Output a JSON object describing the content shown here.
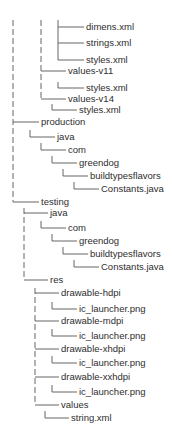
{
  "tree": {
    "rows": [
      {
        "label": "dimens.xml",
        "x": 85,
        "y": 27,
        "conn": [
          58,
          84
        ],
        "branch_x": 58
      },
      {
        "label": "strings.xml",
        "x": 85,
        "y": 43,
        "conn": [
          58,
          84
        ],
        "branch_x": 58
      },
      {
        "label": "styles.xml",
        "x": 85,
        "y": 60,
        "conn": [
          58,
          84
        ],
        "branch_x": 58
      },
      {
        "label": "values-v11",
        "x": 67,
        "y": 71,
        "conn": [
          41,
          66
        ],
        "branch_x": 41
      },
      {
        "label": "styles.xml",
        "x": 85,
        "y": 88,
        "conn": [
          58,
          84
        ],
        "branch_x": 58
      },
      {
        "label": "values-v14",
        "x": 67,
        "y": 99,
        "conn": [
          41,
          66
        ],
        "branch_x": 41
      },
      {
        "label": "styles.xml",
        "x": 78,
        "y": 110,
        "conn": [
          52,
          77
        ],
        "branch_x": 52
      },
      {
        "label": "production",
        "x": 40,
        "y": 122,
        "conn": [
          13,
          39
        ],
        "branch_x": 13
      },
      {
        "label": "java",
        "x": 56,
        "y": 137,
        "conn": [
          30,
          55
        ],
        "branch_x": 30
      },
      {
        "label": "com",
        "x": 67,
        "y": 150,
        "conn": [
          41,
          66
        ],
        "branch_x": 41
      },
      {
        "label": "greendog",
        "x": 78,
        "y": 163,
        "conn": [
          52,
          77
        ],
        "branch_x": 52
      },
      {
        "label": "buildtypesflavors",
        "x": 89,
        "y": 176,
        "conn": [
          63,
          88
        ],
        "branch_x": 63
      },
      {
        "label": "Constants.java",
        "x": 100,
        "y": 189,
        "conn": [
          74,
          99
        ],
        "branch_x": 74
      },
      {
        "label": "testing",
        "x": 40,
        "y": 202,
        "conn": [
          13,
          39
        ],
        "branch_x": 13
      },
      {
        "label": "java",
        "x": 49,
        "y": 213,
        "conn": [
          24,
          48
        ],
        "branch_x": 24
      },
      {
        "label": "com",
        "x": 67,
        "y": 228,
        "conn": [
          41,
          66
        ],
        "branch_x": 41
      },
      {
        "label": "greendog",
        "x": 78,
        "y": 241,
        "conn": [
          52,
          77
        ],
        "branch_x": 52
      },
      {
        "label": "buildtypesflavors",
        "x": 89,
        "y": 254,
        "conn": [
          63,
          88
        ],
        "branch_x": 63
      },
      {
        "label": "Constants.java",
        "x": 100,
        "y": 267,
        "conn": [
          74,
          99
        ],
        "branch_x": 74
      },
      {
        "label": "res",
        "x": 49,
        "y": 280,
        "conn": [
          24,
          48
        ],
        "branch_x": 24
      },
      {
        "label": "drawable-hdpi",
        "x": 60,
        "y": 293,
        "conn": [
          35,
          59
        ],
        "branch_x": 35
      },
      {
        "label": "ic_launcher.png",
        "x": 78,
        "y": 309,
        "conn": [
          52,
          77
        ],
        "branch_x": 52
      },
      {
        "label": "drawable-mdpi",
        "x": 60,
        "y": 321,
        "conn": [
          35,
          59
        ],
        "branch_x": 35
      },
      {
        "label": "ic_launcher.png",
        "x": 78,
        "y": 336,
        "conn": [
          52,
          77
        ],
        "branch_x": 52
      },
      {
        "label": "drawable-xhdpi",
        "x": 60,
        "y": 349,
        "conn": [
          35,
          59
        ],
        "branch_x": 35
      },
      {
        "label": "ic_launcher.png",
        "x": 78,
        "y": 363,
        "conn": [
          52,
          77
        ],
        "branch_x": 52
      },
      {
        "label": "drawable-xxhdpi",
        "x": 60,
        "y": 377,
        "conn": [
          35,
          59
        ],
        "branch_x": 35
      },
      {
        "label": "ic_launcher.png",
        "x": 78,
        "y": 392,
        "conn": [
          52,
          77
        ],
        "branch_x": 52
      },
      {
        "label": "values",
        "x": 60,
        "y": 405,
        "conn": [
          35,
          59
        ],
        "branch_x": 35
      },
      {
        "label": "string.xml",
        "x": 70,
        "y": 418,
        "conn": [
          45,
          69
        ],
        "branch_x": 45
      }
    ],
    "verticals": [
      {
        "x": 13,
        "y1": 20,
        "y2": 202,
        "dashed": true
      },
      {
        "x": 41,
        "y1": 20,
        "y2": 99,
        "dashed": true
      },
      {
        "x": 58,
        "y1": 20,
        "y2": 60,
        "dashed": false
      },
      {
        "x": 58,
        "y1": 82,
        "y2": 88,
        "dashed": false
      },
      {
        "x": 52,
        "y1": 104,
        "y2": 110,
        "dashed": false
      },
      {
        "x": 30,
        "y1": 130,
        "y2": 137,
        "dashed": false
      },
      {
        "x": 41,
        "y1": 143,
        "y2": 150,
        "dashed": false
      },
      {
        "x": 52,
        "y1": 156,
        "y2": 163,
        "dashed": false
      },
      {
        "x": 63,
        "y1": 169,
        "y2": 176,
        "dashed": false
      },
      {
        "x": 74,
        "y1": 182,
        "y2": 189,
        "dashed": false
      },
      {
        "x": 24,
        "y1": 208,
        "y2": 280,
        "dashed": true
      },
      {
        "x": 41,
        "y1": 221,
        "y2": 228,
        "dashed": false
      },
      {
        "x": 52,
        "y1": 234,
        "y2": 241,
        "dashed": false
      },
      {
        "x": 63,
        "y1": 247,
        "y2": 254,
        "dashed": false
      },
      {
        "x": 74,
        "y1": 260,
        "y2": 267,
        "dashed": false
      },
      {
        "x": 35,
        "y1": 288,
        "y2": 405,
        "dashed": true
      },
      {
        "x": 52,
        "y1": 302,
        "y2": 309,
        "dashed": false
      },
      {
        "x": 52,
        "y1": 329,
        "y2": 336,
        "dashed": false
      },
      {
        "x": 52,
        "y1": 356,
        "y2": 363,
        "dashed": false
      },
      {
        "x": 52,
        "y1": 385,
        "y2": 392,
        "dashed": false
      },
      {
        "x": 45,
        "y1": 411,
        "y2": 418,
        "dashed": false
      }
    ]
  }
}
